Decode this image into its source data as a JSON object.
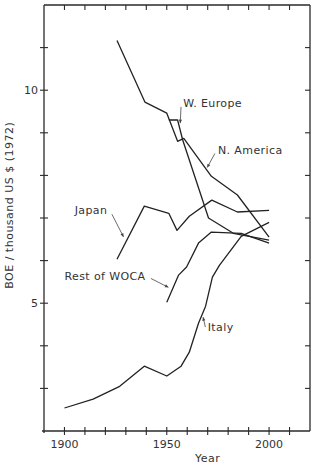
{
  "chart_data": {
    "type": "line",
    "title": "",
    "xlabel": "Year",
    "ylabel": "BOE / thousand US $ (1972)",
    "xlim": [
      1890,
      2020
    ],
    "ylim": [
      2,
      12
    ],
    "x_ticks": [
      1900,
      1910,
      1920,
      1930,
      1940,
      1950,
      1960,
      1970,
      1980,
      1990,
      2000,
      2010
    ],
    "x_tick_labels": [
      {
        "value": 1900,
        "label": "1900"
      },
      {
        "value": 1950,
        "label": "1950"
      },
      {
        "value": 2000,
        "label": "2000"
      }
    ],
    "y_ticks": [
      3,
      4,
      5,
      6,
      7,
      8,
      9,
      10,
      11
    ],
    "y_tick_labels": [
      {
        "value": 5,
        "label": "5"
      },
      {
        "value": 10,
        "label": "10"
      }
    ],
    "grid": false,
    "legend": "inline labels with leader arrows",
    "series": [
      {
        "name": "N. America",
        "points": [
          [
            1925.7,
            11.17
          ],
          [
            1939.3,
            9.72
          ],
          [
            1950,
            9.46
          ],
          [
            1955.3,
            8.8
          ],
          [
            1958.3,
            8.87
          ],
          [
            1971.8,
            7.98
          ],
          [
            1984.5,
            7.54
          ],
          [
            2000,
            6.55
          ]
        ]
      },
      {
        "name": "W. Europe",
        "points": [
          [
            1951,
            9.3
          ],
          [
            1955.3,
            9.3
          ],
          [
            1957.8,
            8.83
          ],
          [
            1970.4,
            7.0
          ],
          [
            1982.5,
            6.64
          ],
          [
            2000,
            6.48
          ]
        ]
      },
      {
        "name": "Japan",
        "points": [
          [
            1925.7,
            6.03
          ],
          [
            1939,
            7.28
          ],
          [
            1951,
            7.11
          ],
          [
            1955,
            6.71
          ],
          [
            1961,
            7.04
          ],
          [
            1972,
            7.42
          ],
          [
            1984.5,
            7.14
          ],
          [
            2000,
            7.18
          ]
        ]
      },
      {
        "name": "Rest of WOCA",
        "points": [
          [
            1950,
            5.02
          ],
          [
            1955.8,
            5.66
          ],
          [
            1959.7,
            5.85
          ],
          [
            1965.5,
            6.41
          ],
          [
            1971.8,
            6.67
          ],
          [
            1986.4,
            6.64
          ],
          [
            2000,
            6.41
          ]
        ]
      },
      {
        "name": "Italy",
        "points": [
          [
            1900,
            2.54
          ],
          [
            1914,
            2.75
          ],
          [
            1927,
            3.05
          ],
          [
            1939,
            3.52
          ],
          [
            1950,
            3.29
          ],
          [
            1957,
            3.52
          ],
          [
            1961,
            3.85
          ],
          [
            1965.5,
            4.53
          ],
          [
            1969,
            4.93
          ],
          [
            1972.3,
            5.61
          ],
          [
            1975.7,
            5.89
          ],
          [
            1986.4,
            6.57
          ],
          [
            2000,
            6.9
          ]
        ]
      }
    ],
    "annotations": [
      {
        "text": "W. Europe",
        "series": "W. Europe",
        "anchor": [
          1958,
          9.6
        ],
        "arrow_to": [
          1956.5,
          9.15
        ]
      },
      {
        "text": "N. America",
        "series": "N. America",
        "anchor": [
          1975,
          8.5
        ],
        "arrow_to": [
          1969,
          8.12
        ]
      },
      {
        "text": "Japan",
        "series": "Japan",
        "anchor": [
          1905,
          7.1
        ],
        "arrow_to": [
          1930,
          6.45
        ]
      },
      {
        "text": "Rest of WOCA",
        "series": "Rest of WOCA",
        "anchor": [
          1900,
          5.55
        ],
        "arrow_to": [
          1952.5,
          5.33
        ]
      },
      {
        "text": "Italy",
        "series": "Italy",
        "anchor": [
          1970,
          4.35
        ],
        "arrow_to": [
          1967.5,
          4.72
        ]
      }
    ]
  }
}
